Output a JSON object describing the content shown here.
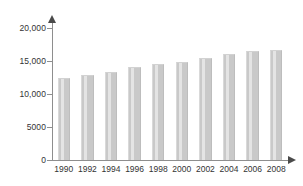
{
  "chart_data": {
    "type": "bar",
    "title": "",
    "xlabel": "",
    "ylabel": "",
    "categories": [
      "1990",
      "1992",
      "1994",
      "1996",
      "1998",
      "2000",
      "2002",
      "2004",
      "2006",
      "2008"
    ],
    "values": [
      12500,
      12900,
      13400,
      14100,
      14500,
      14800,
      15400,
      16000,
      16500,
      16700
    ],
    "ylim": [
      0,
      20000
    ],
    "ytick_values": [
      0,
      5000,
      10000,
      15000,
      20000
    ],
    "ytick_labels": [
      "0",
      "5000",
      "10,000",
      "15,000",
      "20,000"
    ],
    "grid": false,
    "legend": null,
    "legend_position": "none",
    "series": [
      {
        "name": "",
        "values": [
          12500,
          12900,
          13400,
          14100,
          14500,
          14800,
          15400,
          16000,
          16500,
          16700
        ]
      }
    ],
    "annotations": []
  },
  "colors": {
    "bar_fill": "#c9c9c9",
    "bar_highlight": "#e4e4e4",
    "axis": "#8e8e8e",
    "arrow": "#4a4a4a",
    "text": "#333333",
    "background": "#ffffff"
  },
  "axes": {
    "y_axis_name": "y-axis",
    "x_axis_name": "x-axis",
    "y_arrow_icon": "arrow-up-icon",
    "x_arrow_icon": "arrow-right-icon"
  }
}
